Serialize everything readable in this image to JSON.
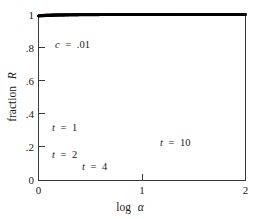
{
  "chart_data": {
    "type": "line",
    "title": "",
    "xlabel": "log α",
    "ylabel": "fraction R",
    "xlim": [
      0,
      2
    ],
    "ylim": [
      0,
      1
    ],
    "xticks": [
      0,
      1,
      2
    ],
    "xticklabels": [
      "0",
      "1",
      "2"
    ],
    "yticks": [
      0,
      0.2,
      0.4,
      0.6,
      0.8,
      1
    ],
    "yticklabels": [
      "0",
      ".2",
      ".4",
      ".6",
      ".8",
      "1"
    ],
    "grid": false,
    "legend_position": "inline-annotations",
    "parameter_annotation": "c = .01",
    "model": "R = 1 / (1 + c * alpha^(-t)), alpha = 10^x, c = 0.01",
    "x": [
      0,
      0.1,
      0.2,
      0.3,
      0.4,
      0.5,
      0.6,
      0.7,
      0.8,
      0.9,
      1.0,
      1.1,
      1.2,
      1.3,
      1.4,
      1.5,
      1.6,
      1.7,
      1.8,
      1.9,
      2.0
    ],
    "series": [
      {
        "name": "t = 1",
        "label": "t = 1",
        "t": 1,
        "values": [
          0.165,
          0.2,
          0.24,
          0.285,
          0.335,
          0.39,
          0.446,
          0.503,
          0.559,
          0.613,
          0.663,
          0.709,
          0.751,
          0.788,
          0.82,
          0.848,
          0.872,
          0.893,
          0.91,
          0.925,
          0.938
        ]
      },
      {
        "name": "t = 2",
        "label": "t = 2",
        "t": 2,
        "values": [
          0.036,
          0.053,
          0.077,
          0.11,
          0.154,
          0.211,
          0.281,
          0.362,
          0.449,
          0.537,
          0.62,
          0.694,
          0.758,
          0.81,
          0.853,
          0.887,
          0.913,
          0.934,
          0.95,
          0.962,
          0.971
        ]
      },
      {
        "name": "t = 4",
        "label": "t = 4",
        "t": 4,
        "values": [
          0.004,
          0.008,
          0.016,
          0.031,
          0.059,
          0.11,
          0.196,
          0.323,
          0.479,
          0.633,
          0.759,
          0.849,
          0.908,
          0.945,
          0.967,
          0.98,
          0.988,
          0.993,
          0.996,
          0.998,
          0.999
        ]
      },
      {
        "name": "t = 10",
        "label": "t = 10",
        "t": 10,
        "values": [
          0.0,
          0.0,
          0.0,
          0.0,
          0.001,
          0.003,
          0.016,
          0.076,
          0.288,
          0.65,
          0.896,
          0.972,
          0.992,
          0.998,
          0.999,
          1.0,
          1.0,
          1.0,
          1.0,
          1.0,
          1.0
        ]
      }
    ],
    "crossover_point": {
      "x": 1.0,
      "y": 0.5
    },
    "annotations": [
      {
        "text": "c = .01",
        "x": 0.17,
        "y": 0.8
      },
      {
        "text": "t = 1",
        "x": 0.13,
        "y": 0.265
      },
      {
        "text": "t = 2",
        "x": 0.13,
        "y": 0.145
      },
      {
        "text": "t = 4",
        "x": 0.42,
        "y": 0.075
      },
      {
        "text": "t = 10",
        "x": 1.18,
        "y": 0.205
      }
    ],
    "colors": {
      "curve": "#000000",
      "axis": "#3a3a3a",
      "text": "#1a1a1a",
      "background": "#ffffff"
    }
  },
  "axes": {
    "x_title_parts": {
      "main": "log",
      "symbol": "α"
    },
    "y_title_parts": {
      "main": "fraction",
      "symbol": "R"
    }
  },
  "annotation_labels": {
    "c_param": {
      "var": "c",
      "eq": "=",
      "val": ".01"
    },
    "t1": {
      "var": "t",
      "eq": "=",
      "val": "1"
    },
    "t2": {
      "var": "t",
      "eq": "=",
      "val": "2"
    },
    "t4": {
      "var": "t",
      "eq": "=",
      "val": "4"
    },
    "t10": {
      "var": "t",
      "eq": "=",
      "val": "10"
    }
  }
}
